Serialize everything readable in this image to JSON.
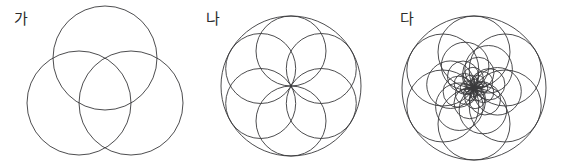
{
  "canvas": {
    "width": 572,
    "height": 168,
    "background": "#ffffff",
    "stroke_color": "#39393b",
    "stroke_width": 0.9
  },
  "figures": [
    {
      "id": "figure-ga",
      "label": "가",
      "label_x": 14,
      "label_y": 12,
      "type": "trefoil-three-circles",
      "description": "Three equal overlapping circles arranged with centers on an equilateral triangle, forming a trefoil / triquetra outline",
      "center_x": 105,
      "center_y": 88,
      "circle_radius": 52,
      "center_offset": 30,
      "circle_count": 3,
      "circles": [
        {
          "cx": 105,
          "cy": 58,
          "r": 52
        },
        {
          "cx": 79,
          "cy": 103,
          "r": 52
        },
        {
          "cx": 131,
          "cy": 103,
          "r": 52
        }
      ]
    },
    {
      "id": "figure-na",
      "label": "나",
      "label_x": 206,
      "label_y": 12,
      "type": "six-petal-rosette",
      "description": "Large circle with six inner circles of half radius, centers on a ring of half radius, each passing through the common centre and tangent to the outer circle",
      "center_x": 291,
      "center_y": 86,
      "outer_radius": 70,
      "inner_radius": 35,
      "inner_count": 6,
      "inner_start_angle_deg": 90,
      "inner_circles": [
        {
          "cx": 291,
          "cy": 51,
          "r": 35,
          "angle_deg": 90
        },
        {
          "cx": 321.31,
          "cy": 68.5,
          "r": 35,
          "angle_deg": 30
        },
        {
          "cx": 321.31,
          "cy": 103.5,
          "r": 35,
          "angle_deg": -30
        },
        {
          "cx": 291,
          "cy": 121,
          "r": 35,
          "angle_deg": -90
        },
        {
          "cx": 260.69,
          "cy": 103.5,
          "r": 35,
          "angle_deg": -150
        },
        {
          "cx": 260.69,
          "cy": 68.5,
          "r": 35,
          "angle_deg": 150
        }
      ]
    },
    {
      "id": "figure-da",
      "label": "다",
      "label_x": 400,
      "label_y": 12,
      "type": "logarithmic-spiral-rosette",
      "description": "Nested ring of circles all passing through a common centre, radii shrinking geometrically while rotating, producing a six-armed pinwheel spiral",
      "center_x": 474,
      "center_y": 88,
      "outer_radius": 72,
      "arms": 6,
      "rings": 6,
      "shrink_ratio": 0.66,
      "twist_per_ring_deg": 22,
      "start_angle_deg": 90
    }
  ]
}
